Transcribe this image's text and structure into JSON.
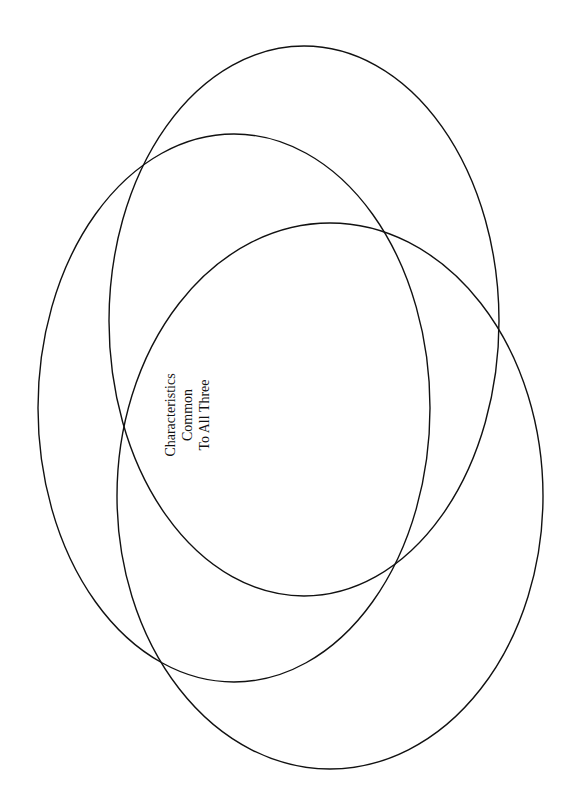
{
  "diagram": {
    "type": "venn",
    "center_label": [
      "Characteristics",
      "Common",
      "To All Three"
    ],
    "stroke_color": "#111111",
    "ellipses": [
      {
        "name": "top-right",
        "cx": 304,
        "cy": 321,
        "rx": 195,
        "ry": 275
      },
      {
        "name": "left",
        "cx": 234,
        "cy": 408,
        "rx": 196,
        "ry": 274
      },
      {
        "name": "bottom",
        "cx": 330,
        "cy": 496,
        "rx": 213,
        "ry": 273
      }
    ]
  }
}
